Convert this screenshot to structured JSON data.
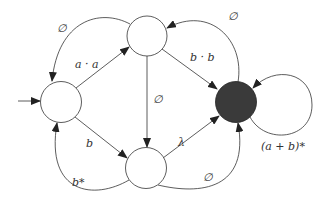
{
  "diagram": {
    "type": "finite-automaton",
    "states": [
      {
        "id": "q0",
        "initial": true,
        "final": false
      },
      {
        "id": "q1",
        "initial": false,
        "final": false
      },
      {
        "id": "q2",
        "initial": false,
        "final": false
      },
      {
        "id": "q3",
        "initial": false,
        "final": true
      }
    ],
    "edges": [
      {
        "id": "e_q0_q1",
        "from": "q0",
        "to": "q1",
        "label": "a · a"
      },
      {
        "id": "e_q1_q0",
        "from": "q1",
        "to": "q0",
        "label": "∅"
      },
      {
        "id": "e_q1_q3",
        "from": "q1",
        "to": "q3",
        "label": "b · b"
      },
      {
        "id": "e_q3_q1",
        "from": "q3",
        "to": "q1",
        "label": "∅"
      },
      {
        "id": "e_q1_q2",
        "from": "q1",
        "to": "q2",
        "label": "∅"
      },
      {
        "id": "e_q0_q2",
        "from": "q0",
        "to": "q2",
        "label": "b"
      },
      {
        "id": "e_q2_q0",
        "from": "q2",
        "to": "q0",
        "label": "b*"
      },
      {
        "id": "e_q2_q3_lambda",
        "from": "q2",
        "to": "q3",
        "label": "λ"
      },
      {
        "id": "e_q2_q3_empty",
        "from": "q2",
        "to": "q3",
        "label": "∅"
      },
      {
        "id": "e_q3_q3",
        "from": "q3",
        "to": "q3",
        "label": "(a + b)*"
      }
    ],
    "colors": {
      "final_fill": "#3a3a3a",
      "stroke": "#333333"
    }
  }
}
